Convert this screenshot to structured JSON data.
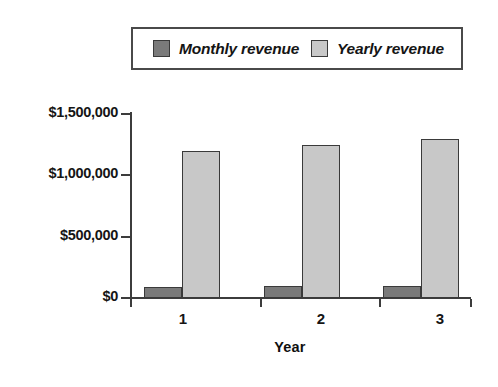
{
  "chart_data": {
    "type": "bar",
    "title": "",
    "subtitle": "",
    "xlabel": "Year",
    "ylabel": "",
    "categories": [
      "1",
      "2",
      "3"
    ],
    "series": [
      {
        "name": "Monthly revenue",
        "color": "#7a7a7a",
        "values": [
          90000,
          95000,
          100000
        ]
      },
      {
        "name": "Yearly revenue",
        "color": "#c8c8c8",
        "values": [
          1200000,
          1250000,
          1300000
        ]
      }
    ],
    "ylim": [
      0,
      1500000
    ],
    "ytick_values": [
      0,
      500000,
      1000000,
      1500000
    ],
    "ytick_labels": [
      "$0",
      "$500,000",
      "$1,000,000",
      "$1,500,000"
    ],
    "grid": false,
    "legend_position": "top"
  },
  "legend": {
    "entries": [
      {
        "label": "Monthly revenue",
        "swatch_color": "#7a7a7a"
      },
      {
        "label": "Yearly revenue",
        "swatch_color": "#c8c8c8"
      }
    ]
  },
  "axes": {
    "x_title": "Year",
    "x_tick_labels": [
      "1",
      "2",
      "3"
    ],
    "y_tick_labels": [
      "$1,500,000",
      "$1,000,000",
      "$500,000",
      "$0"
    ]
  },
  "colors": {
    "monthly": "#7a7a7a",
    "yearly": "#c8c8c8",
    "axis": "#3c3c3c",
    "text": "#151515",
    "background": "#ffffff"
  }
}
